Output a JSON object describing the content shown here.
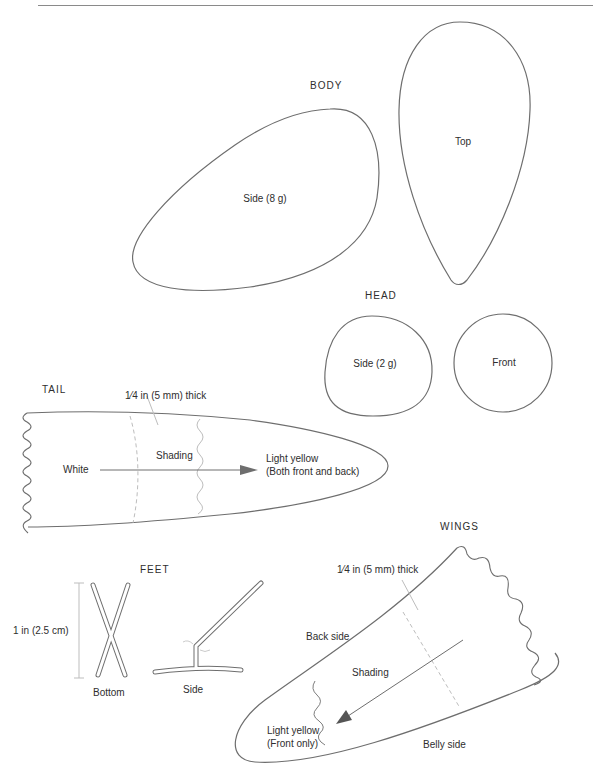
{
  "sections": {
    "body": {
      "heading": "BODY",
      "side_label": "Side (8 g)",
      "top_label": "Top"
    },
    "head": {
      "heading": "HEAD",
      "side_label": "Side (2 g)",
      "front_label": "Front"
    },
    "tail": {
      "heading": "TAIL",
      "thickness_note": "1⁄4 in (5 mm) thick",
      "shading_label": "Shading",
      "white_label": "White",
      "light_yellow_line1": "Light yellow",
      "light_yellow_line2": "(Both front and back)"
    },
    "feet": {
      "heading": "FEET",
      "dimension_label": "1 in (2.5 cm)",
      "bottom_label": "Bottom",
      "side_label": "Side"
    },
    "wings": {
      "heading": "WINGS",
      "thickness_note": "1⁄4 in (5 mm) thick",
      "back_side_label": "Back side",
      "shading_label": "Shading",
      "light_yellow_line1": "Light yellow",
      "light_yellow_line2": "(Front only)",
      "belly_side_label": "Belly side"
    }
  },
  "colors": {
    "outline": "#6e6e6e",
    "guide": "#b8b8b8",
    "text": "#2e2e2e",
    "background": "#ffffff"
  }
}
